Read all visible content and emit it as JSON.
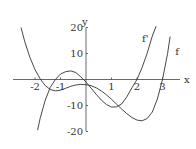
{
  "chart_data": {
    "type": "line",
    "title": "",
    "xlabel": "x",
    "ylabel": "y",
    "xlim": [
      -2.6,
      3.5
    ],
    "ylim": [
      -20,
      20
    ],
    "grid": false,
    "legend": "inline labels near curves",
    "x_ticks": [
      -2,
      -1,
      1,
      2,
      3
    ],
    "x_tick_labels": [
      "-2",
      "-1",
      "1",
      "2",
      "3"
    ],
    "y_ticks": [
      20,
      10,
      -10,
      -20
    ],
    "y_tick_labels": [
      "20",
      "10",
      "-10",
      "-20"
    ],
    "series": [
      {
        "name": "f",
        "label": "f",
        "x": [
          -2.55,
          -2.4,
          -2.2,
          -2.0,
          -1.8,
          -1.6,
          -1.4,
          -1.2,
          -1.0,
          -0.8,
          -0.6,
          -0.4,
          -0.2,
          0.0,
          0.2,
          0.4,
          0.6,
          0.8,
          1.0,
          1.2,
          1.4,
          1.6,
          1.8,
          2.0,
          2.2,
          2.4,
          2.6,
          2.8,
          3.0,
          3.2,
          3.3
        ],
        "y": [
          20,
          14.5,
          8.5,
          3.8,
          0.3,
          -2.3,
          -3.9,
          -4.4,
          -4.1,
          -3.4,
          -2.6,
          -2.1,
          -1.9,
          -2.0,
          -2.4,
          -3.2,
          -4.4,
          -5.9,
          -7.6,
          -9.5,
          -11.4,
          -13.1,
          -14.6,
          -15.6,
          -15.9,
          -15.0,
          -12.5,
          -7.5,
          0.0,
          10.0,
          16.5
        ]
      },
      {
        "name": "f'",
        "label": "f'",
        "x": [
          -1.9,
          -1.8,
          -1.6,
          -1.4,
          -1.2,
          -1.0,
          -0.8,
          -0.6,
          -0.4,
          -0.2,
          0.0,
          0.2,
          0.4,
          0.6,
          0.8,
          1.0,
          1.2,
          1.4,
          1.6,
          1.8,
          2.0,
          2.2,
          2.4,
          2.6,
          2.75
        ],
        "y": [
          -19.5,
          -15.0,
          -8.0,
          -3.0,
          0.0,
          2.1,
          3.0,
          3.3,
          2.7,
          1.0,
          -1.0,
          -3.3,
          -5.7,
          -7.9,
          -9.6,
          -10.6,
          -10.5,
          -9.4,
          -6.7,
          -3.2,
          0.0,
          4.6,
          10.1,
          16.7,
          20.5
        ]
      }
    ],
    "annotations": [
      {
        "text": "f'",
        "x": 2.2,
        "y": 14.5
      },
      {
        "text": "f",
        "x": 3.5,
        "y": 9.5
      }
    ]
  }
}
